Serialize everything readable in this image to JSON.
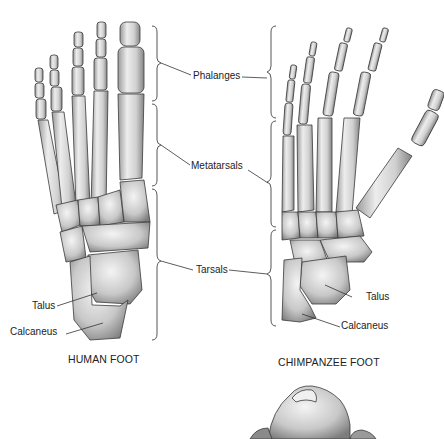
{
  "diagram": {
    "center_labels": {
      "phalanges": "Phalanges",
      "metatarsals": "Metatarsals",
      "tarsals": "Tarsals"
    },
    "human_foot": {
      "caption": "HUMAN FOOT",
      "labels": {
        "talus": "Talus",
        "calcaneus": "Calcaneus"
      }
    },
    "chimpanzee_foot": {
      "caption": "CHIMPANZEE FOOT",
      "labels": {
        "talus": "Talus",
        "calcaneus": "Calcaneus"
      }
    },
    "colors": {
      "background": "#ffffff",
      "bone_light": "#e8e8e8",
      "bone_mid": "#bdbdbd",
      "bone_dark": "#6e6e6e",
      "outline": "#3a3a3a",
      "leader_line": "#333333"
    }
  }
}
